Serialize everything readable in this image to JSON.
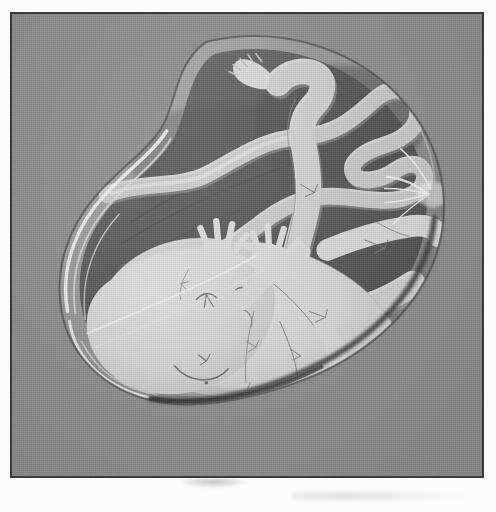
{
  "document": {
    "kind": "scanned-illustration",
    "title": "Fetus in the womb",
    "medium": "pencil and wash drawing",
    "palette": {
      "paper": "#fbfbfb",
      "plate_background": "#8e8e8e",
      "frame_border": "#3a3a3a",
      "amniotic_dark": "#5d5d5d",
      "amniotic_darkest": "#4a4a4a",
      "sac_wall": "#a9a9a9",
      "sac_highlight": "#f2f2f2",
      "body_fill": "#dcdcdc",
      "body_shadow": "#c4c4c4",
      "cord_fill": "#d5d5d5",
      "pencil_line": "#6e6e6e"
    },
    "frame": {
      "x": 10,
      "y": 12,
      "width": 474,
      "height": 466,
      "border_width": 2
    }
  },
  "figure": {
    "label": "fetus-in-amniotic-sac",
    "parts": [
      {
        "name": "amniotic-sac",
        "label": "Amniotic sac",
        "shape": "bean / kidney outline",
        "fill": "#5d5d5d"
      },
      {
        "name": "sac-wall",
        "label": "Sac membrane wall",
        "fill": "#a9a9a9"
      },
      {
        "name": "fetus-head",
        "label": "Head",
        "features": [
          "eye",
          "eyebrow",
          "nose",
          "mouth",
          "ear"
        ]
      },
      {
        "name": "fetus-torso",
        "label": "Torso"
      },
      {
        "name": "left-hand",
        "label": "Left hand",
        "fingers": 5
      },
      {
        "name": "right-hand",
        "label": "Right hand",
        "fingers": 5
      },
      {
        "name": "left-arm",
        "label": "Left arm"
      },
      {
        "name": "right-arm",
        "label": "Right arm"
      },
      {
        "name": "upper-leg",
        "label": "Raised leg with foot",
        "toes": 5
      },
      {
        "name": "lower-leg",
        "label": "Lower leg"
      },
      {
        "name": "umbilical-cord",
        "label": "Umbilical cord",
        "shape": "zig-zag S curve"
      }
    ]
  },
  "artifacts": {
    "scan_smudge": "faint gray smudge below plate",
    "scan_smudge_caption": "small dark mark under lower frame edge"
  }
}
